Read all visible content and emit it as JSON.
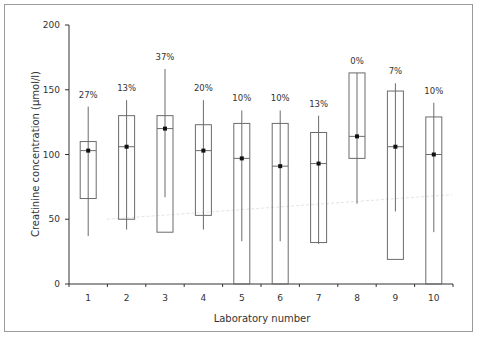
{
  "chart_data": {
    "type": "box",
    "title": "",
    "xlabel": "Laboratory number",
    "ylabel": "Creatinine concentration (µmol/l)",
    "ylim": [
      0,
      200
    ],
    "yticks": [
      0,
      50,
      100,
      150,
      200
    ],
    "grid": false,
    "legend": null,
    "categories": [
      "1",
      "2",
      "3",
      "4",
      "5",
      "6",
      "7",
      "8",
      "9",
      "10"
    ],
    "series": [
      {
        "lab": "1",
        "label": "27%",
        "whisker_high": 137,
        "q3": 110,
        "median": 103,
        "mean": 103,
        "q1": 66,
        "whisker_low": 37
      },
      {
        "lab": "2",
        "label": "13%",
        "whisker_high": 142,
        "q3": 130,
        "median": 106,
        "mean": 106,
        "q1": 50,
        "whisker_low": 42
      },
      {
        "lab": "3",
        "label": "37%",
        "whisker_high": 166,
        "q3": 130,
        "median": 120,
        "mean": 120,
        "q1": 40,
        "whisker_low": 67
      },
      {
        "lab": "4",
        "label": "20%",
        "whisker_high": 142,
        "q3": 123,
        "median": 103,
        "mean": 103,
        "q1": 53,
        "whisker_low": 42
      },
      {
        "lab": "5",
        "label": "10%",
        "whisker_high": 134,
        "q3": 124,
        "median": 97,
        "mean": 97,
        "q1": 0,
        "whisker_low": 33
      },
      {
        "lab": "6",
        "label": "10%",
        "whisker_high": 134,
        "q3": 124,
        "median": 91,
        "mean": 91,
        "q1": 0,
        "whisker_low": 33
      },
      {
        "lab": "7",
        "label": "13%",
        "whisker_high": 130,
        "q3": 117,
        "median": 93,
        "mean": 93,
        "q1": 32,
        "whisker_low": 31
      },
      {
        "lab": "8",
        "label": "0%",
        "whisker_high": 163,
        "q3": 163,
        "median": 114,
        "mean": 114,
        "q1": 97,
        "whisker_low": 62
      },
      {
        "lab": "9",
        "label": "7%",
        "whisker_high": 155,
        "q3": 149,
        "median": 106,
        "mean": 106,
        "q1": 19,
        "whisker_low": 56
      },
      {
        "lab": "10",
        "label": "10%",
        "whisker_high": 140,
        "q3": 129,
        "median": 100,
        "mean": 100,
        "q1": 0,
        "whisker_low": 40
      }
    ],
    "annotations": [
      "27%",
      "13%",
      "37%",
      "20%",
      "10%",
      "10%",
      "13%",
      "0%",
      "7%",
      "10%"
    ]
  },
  "colors": {
    "box_stroke": "#6b6b6b",
    "whisker": "#6b6b6b",
    "mean_dot": "#111111",
    "axis": "#333333",
    "frame": "#9a9a9a",
    "faint_line": "#e4e4e4"
  }
}
